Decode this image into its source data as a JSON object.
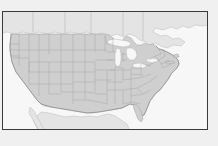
{
  "figure": {
    "title": "",
    "width": 218,
    "height": 146,
    "background_color": "#f0f0f0",
    "frame": {
      "x": 2,
      "y": 11,
      "width": 206,
      "height": 119,
      "border_color": "#3a3a3a",
      "border_width": 1,
      "fill_color": "#f7f7f7"
    }
  },
  "map": {
    "name": "continental-united-states",
    "projection": "equirectangular-like",
    "region_label": "Continental United States",
    "colors": {
      "us_land_fill": "#cfcfcf",
      "us_state_border": "#9a9a9a",
      "us_coastline": "#7d7d7d",
      "foreign_land_fill": "#e4e4e4",
      "foreign_border": "#b4b4b4",
      "water_fill": "#f7f7f7",
      "water_border": "#a8a8a8"
    },
    "features": {
      "us_states_shown": true,
      "state_boundaries": true,
      "great_lakes": true,
      "canada_shown": true,
      "mexico_shown": true,
      "labels": false,
      "gridlines": false,
      "legend": false,
      "axis_ticks": false
    },
    "water_bodies": [
      "Lake Superior",
      "Lake Michigan",
      "Lake Huron",
      "Lake Erie",
      "Lake Ontario",
      "Atlantic Ocean",
      "Pacific Ocean",
      "Gulf of Mexico"
    ],
    "neighbors": [
      "Canada",
      "Mexico"
    ]
  }
}
